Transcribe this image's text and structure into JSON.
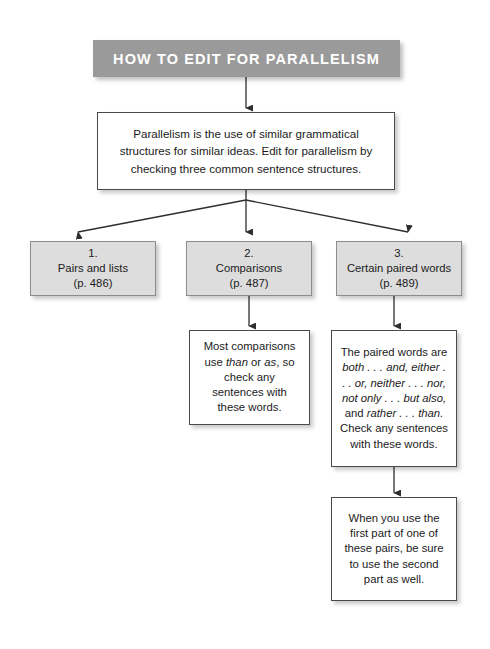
{
  "header": {
    "title": "HOW TO EDIT FOR PARALLELISM",
    "banner_color": "#9a9a9a",
    "text_color": "#ffffff"
  },
  "intro": {
    "text": "Parallelism is the use of similar grammatical structures for similar ideas. Edit for parallelism by checking three common sentence structures."
  },
  "categories": [
    {
      "number": "1.",
      "label": "Pairs and lists",
      "page": "(p. 486)"
    },
    {
      "number": "2.",
      "label": "Comparisons",
      "page": "(p. 487)"
    },
    {
      "number": "3.",
      "label": "Certain paired words",
      "page": "(p. 489)"
    }
  ],
  "details": {
    "comparisons": {
      "line1": "Most comparisons",
      "line2_pre": "use ",
      "line2_em1": "than",
      "line2_mid": " or ",
      "line2_em2": "as",
      "line2_post": ", so",
      "line3": "check any sentences",
      "line4": "with these words."
    },
    "paired_words": {
      "line1": "The paired words are",
      "line2_em": "both . . . and, either . . .",
      "line3_em": "or, neither . . . nor,",
      "line4_em": "not only . . . but also,",
      "line5_pre": "and ",
      "line5_em": "rather . . . than.",
      "line6": "Check any sentences",
      "line7": "with these words."
    },
    "paired_words_note": {
      "text": "When you use the first part of one of these pairs, be sure to use the second part as well."
    }
  },
  "colors": {
    "box_fill_gray": "#dddddd",
    "box_fill_white": "#ffffff",
    "border": "#4a4a4a",
    "connector": "#3a3a3a"
  }
}
